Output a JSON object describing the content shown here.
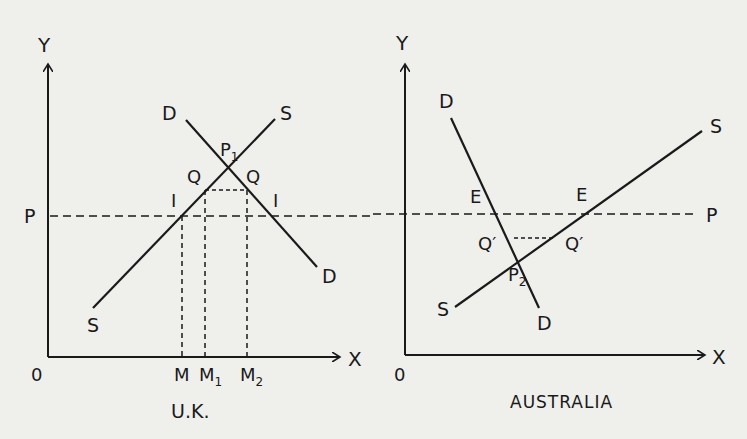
{
  "figure": {
    "background_color": "#efefec",
    "ink_color": "#1a1a1a",
    "panels": [
      {
        "name": "U.K.",
        "title": "U.K.",
        "axes": {
          "y_label": "Y",
          "x_label": "X",
          "origin_label": "0"
        },
        "price_line_label": "P",
        "curves": [
          {
            "name": "demand",
            "label_start": "D",
            "label_end": "D"
          },
          {
            "name": "supply",
            "label_start": "S",
            "label_end": "S"
          }
        ],
        "points": {
          "equilibrium": "P",
          "equilibrium_sub": "1",
          "quota_left": "Q",
          "quota_right": "Q",
          "import_left": "I",
          "import_right": "I"
        },
        "x_ticks": [
          {
            "base": "M",
            "sub": ""
          },
          {
            "base": "M",
            "sub": "1"
          },
          {
            "base": "M",
            "sub": "2"
          }
        ]
      },
      {
        "name": "AUSTRALIA",
        "title": "AUSTRALIA",
        "axes": {
          "y_label": "Y",
          "x_label": "X",
          "origin_label": "0"
        },
        "price_line_label": "P",
        "curves": [
          {
            "name": "demand",
            "label_start": "D",
            "label_end": "D"
          },
          {
            "name": "supply",
            "label_start": "S",
            "label_end": "S"
          }
        ],
        "points": {
          "equilibrium": "P",
          "equilibrium_sub": "2",
          "export_left": "E",
          "export_right": "E",
          "quota_left": "Q′",
          "quota_right": "Q′"
        }
      }
    ]
  }
}
